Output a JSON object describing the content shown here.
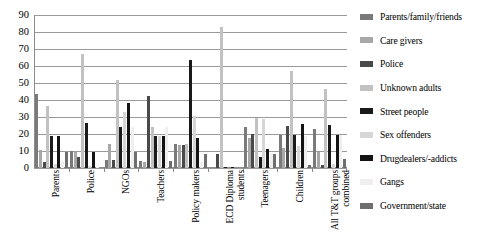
{
  "chart_data": {
    "type": "bar",
    "title": "",
    "xlabel": "",
    "ylabel": "",
    "ylim": [
      0,
      90
    ],
    "ytick_step": 10,
    "yticks": [
      90,
      80,
      70,
      60,
      50,
      40,
      30,
      20,
      10,
      0
    ],
    "grid": true,
    "legend_position": "right",
    "categories": [
      "Parents",
      "Police",
      "NGOs",
      "Teachers",
      "Policy makers",
      "ECD Diploma\nstudents",
      "Teenagers",
      "Children",
      "All T&T groups\ncombined"
    ],
    "series": [
      {
        "name": "Parents/family/friends",
        "color": "#7a7a7a",
        "values": [
          43.5,
          10.0,
          4.5,
          4.0,
          14.0,
          0.0,
          24.0,
          19.5,
          23.0
        ]
      },
      {
        "name": "Care givers",
        "color": "#a8a8a8",
        "values": [
          10.5,
          9.5,
          14.0,
          3.5,
          13.5,
          0.0,
          17.5,
          11.5,
          9.5
        ]
      },
      {
        "name": "Police",
        "color": "#4a4a4a",
        "values": [
          3.5,
          6.5,
          4.5,
          42.5,
          13.5,
          8.5,
          20.0,
          24.5,
          2.0
        ]
      },
      {
        "name": "Unknown adults",
        "color": "#c2c2c2",
        "values": [
          36.5,
          67.0,
          52.0,
          24.0,
          14.0,
          83.0,
          29.5,
          57.0,
          46.5
        ]
      },
      {
        "name": "Street people",
        "color": "#1a1a1a",
        "values": [
          19.0,
          26.5,
          24.0,
          19.0,
          63.5,
          0.5,
          6.5,
          19.5,
          25.5
        ]
      },
      {
        "name": "Sex offenders",
        "color": "#d6d6d6",
        "values": [
          2.5,
          1.0,
          33.0,
          19.0,
          30.5,
          0.0,
          29.0,
          13.0,
          2.5
        ]
      },
      {
        "name": "Drugdealers/-addicts",
        "color": "#141414",
        "values": [
          19.0,
          9.5,
          38.0,
          19.0,
          17.5,
          0.5,
          11.0,
          26.0,
          19.5
        ]
      },
      {
        "name": "Gangs",
        "color": "#efefef",
        "values": [
          3.5,
          0.5,
          24.0,
          24.0,
          3.5,
          0.0,
          9.0,
          19.0,
          19.5
        ]
      },
      {
        "name": "Government/state",
        "color": "#6e6e6e",
        "values": [
          9.5,
          0.0,
          9.5,
          4.0,
          8.5,
          0.0,
          8.5,
          1.5,
          5.5
        ]
      }
    ]
  },
  "legend": {
    "items": [
      {
        "label": "Parents/family/friends",
        "color": "#7a7a7a"
      },
      {
        "label": "Care givers",
        "color": "#a8a8a8"
      },
      {
        "label": "Police",
        "color": "#4a4a4a"
      },
      {
        "label": "Unknown adults",
        "color": "#c2c2c2"
      },
      {
        "label": "Street people",
        "color": "#1a1a1a"
      },
      {
        "label": "Sex offenders",
        "color": "#d6d6d6"
      },
      {
        "label": "Drugdealers/-addicts",
        "color": "#141414"
      },
      {
        "label": "Gangs",
        "color": "#efefef"
      },
      {
        "label": "Government/state",
        "color": "#6e6e6e"
      }
    ]
  }
}
